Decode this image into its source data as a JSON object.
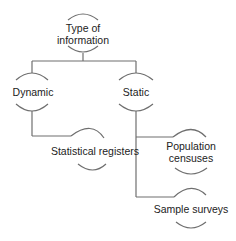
{
  "diagram": {
    "type": "tree",
    "root": {
      "label_line1": "Type of",
      "label_line2": "information"
    },
    "branches": [
      {
        "label": "Dynamic",
        "children": [
          {
            "label": "Statistical registers"
          }
        ]
      },
      {
        "label": "Static",
        "children": [
          {
            "label_line1": "Population",
            "label_line2": "censuses"
          },
          {
            "label": "Sample surveys"
          }
        ]
      }
    ],
    "colors": {
      "line": "#6f6f6f",
      "text": "#222222",
      "background": "#ffffff"
    }
  }
}
